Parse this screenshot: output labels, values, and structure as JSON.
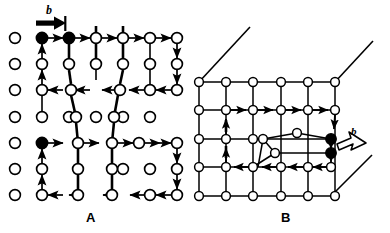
{
  "figure": {
    "type": "diagram",
    "background_color": "#ffffff",
    "line_color": "#000000",
    "atom_fill_open": "#ffffff",
    "atom_fill_filled": "#000000"
  },
  "panels": [
    {
      "id": "A",
      "label": "A",
      "label_x": 86,
      "label_y": 210,
      "description": "Two-dimensional lattice with open-circle atoms; two Burgers circuits traced with arrows; closure failure vector b marked at top by a solid black arrow between two filled atoms",
      "burgers_label": "b",
      "burgers_label_x": 46,
      "burgers_label_y": 6,
      "burgers_arrow_style": "solid-filled",
      "lattice_rows": 7,
      "lattice_cols": 7,
      "filled_atoms": 3
    },
    {
      "id": "B",
      "label": "B",
      "label_x": 281,
      "label_y": 210,
      "description": "Three-dimensional block face showing a lattice grid with a Burgers circuit drawn around a dislocation core; slip-plane trace lines project from the corners; the closure failure b is indicated by an open outline arrow",
      "burgers_label": "b",
      "burgers_label_x": 354,
      "burgers_label_y": 131,
      "burgers_arrow_style": "open-outline",
      "lattice_rows": 6,
      "lattice_cols": 6,
      "filled_atoms": 2
    }
  ]
}
